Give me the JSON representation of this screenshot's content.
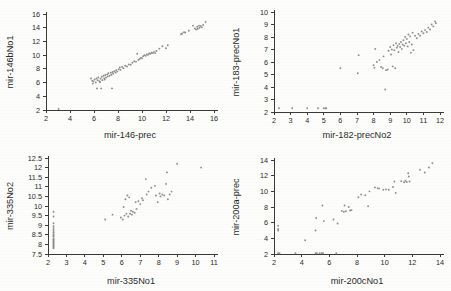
{
  "figure": {
    "background_color": "#fdfdfc",
    "marker_color": "#8d8d8d",
    "axis_color": "#3a3a3a",
    "text_color": "#2b2b2b"
  },
  "chart_data": [
    {
      "type": "scatter",
      "panel": "top-left",
      "title": "",
      "xlabel": "mir-146-prec",
      "ylabel": "mir-146bNo1",
      "xlim": [
        2,
        16
      ],
      "ylim": [
        2,
        16
      ],
      "xticks": [
        2,
        4,
        6,
        8,
        10,
        12,
        14,
        16
      ],
      "yticks": [
        2,
        4,
        6,
        8,
        10,
        12,
        14,
        16
      ],
      "xticklabels": [
        "2",
        "4",
        "6",
        "8",
        "10",
        "12",
        "14",
        "16"
      ],
      "yticklabels": [
        "2",
        "4",
        "6",
        "8",
        "10",
        "12",
        "14",
        "16"
      ],
      "grid": false,
      "legend": false,
      "points": [
        [
          3.05,
          2.15
        ],
        [
          5.75,
          6.6
        ],
        [
          5.85,
          6.25
        ],
        [
          5.95,
          6.15
        ],
        [
          5.9,
          5.85
        ],
        [
          6.05,
          6.45
        ],
        [
          6.15,
          6.0
        ],
        [
          6.2,
          6.6
        ],
        [
          6.3,
          6.35
        ],
        [
          6.25,
          5.15
        ],
        [
          6.35,
          6.75
        ],
        [
          6.45,
          6.2
        ],
        [
          6.5,
          6.05
        ],
        [
          6.55,
          6.55
        ],
        [
          6.6,
          5.15
        ],
        [
          6.65,
          6.85
        ],
        [
          6.7,
          6.35
        ],
        [
          6.8,
          7.0
        ],
        [
          6.85,
          6.6
        ],
        [
          6.9,
          6.45
        ],
        [
          6.95,
          7.1
        ],
        [
          7.0,
          6.75
        ],
        [
          7.1,
          7.2
        ],
        [
          7.15,
          6.9
        ],
        [
          7.2,
          7.35
        ],
        [
          7.3,
          7.0
        ],
        [
          7.4,
          7.45
        ],
        [
          7.45,
          7.15
        ],
        [
          7.5,
          5.15
        ],
        [
          7.55,
          7.55
        ],
        [
          7.6,
          7.3
        ],
        [
          7.7,
          7.65
        ],
        [
          7.8,
          7.45
        ],
        [
          7.85,
          7.8
        ],
        [
          7.95,
          7.6
        ],
        [
          8.05,
          7.95
        ],
        [
          8.15,
          8.2
        ],
        [
          8.2,
          7.85
        ],
        [
          8.35,
          8.3
        ],
        [
          8.45,
          8.1
        ],
        [
          8.6,
          8.45
        ],
        [
          8.75,
          8.35
        ],
        [
          8.9,
          8.65
        ],
        [
          9.05,
          8.6
        ],
        [
          9.2,
          8.9
        ],
        [
          9.35,
          9.1
        ],
        [
          9.5,
          9.05
        ],
        [
          9.6,
          10.2
        ],
        [
          9.7,
          9.3
        ],
        [
          9.8,
          9.45
        ],
        [
          9.9,
          9.6
        ],
        [
          10.0,
          9.55
        ],
        [
          10.1,
          9.85
        ],
        [
          10.2,
          10.0
        ],
        [
          10.3,
          9.9
        ],
        [
          10.4,
          10.1
        ],
        [
          10.5,
          10.05
        ],
        [
          10.6,
          10.25
        ],
        [
          10.7,
          10.2
        ],
        [
          10.8,
          10.35
        ],
        [
          10.9,
          10.3
        ],
        [
          11.0,
          10.45
        ],
        [
          11.1,
          10.3
        ],
        [
          11.2,
          10.6
        ],
        [
          11.45,
          10.95
        ],
        [
          11.7,
          11.3
        ],
        [
          12.0,
          11.0
        ],
        [
          12.15,
          11.45
        ],
        [
          13.25,
          13.05
        ],
        [
          13.35,
          13.15
        ],
        [
          13.5,
          13.35
        ],
        [
          13.6,
          13.3
        ],
        [
          13.9,
          13.55
        ],
        [
          14.25,
          14.3
        ],
        [
          14.4,
          13.9
        ],
        [
          14.5,
          13.75
        ],
        [
          14.6,
          14.15
        ],
        [
          14.65,
          13.85
        ],
        [
          14.75,
          14.3
        ],
        [
          14.8,
          14.0
        ],
        [
          14.9,
          14.25
        ],
        [
          15.0,
          14.05
        ],
        [
          15.1,
          14.4
        ],
        [
          15.3,
          14.85
        ]
      ]
    },
    {
      "type": "scatter",
      "panel": "top-right",
      "title": "",
      "xlabel": "mir-182-precNo2",
      "ylabel": "mir-183-precNo1",
      "xlim": [
        2,
        12
      ],
      "ylim": [
        2,
        10
      ],
      "xticks": [
        2,
        3,
        4,
        5,
        6,
        7,
        8,
        9,
        10,
        11,
        12
      ],
      "yticks": [
        2,
        3,
        4,
        5,
        6,
        7,
        8,
        9,
        10
      ],
      "xticklabels": [
        "2",
        "3",
        "4",
        "5",
        "6",
        "7",
        "8",
        "9",
        "10",
        "11",
        "12"
      ],
      "yticklabels": [
        "2",
        "3",
        "4",
        "5",
        "6",
        "7",
        "8",
        "9",
        "10"
      ],
      "grid": false,
      "legend": false,
      "points": [
        [
          2.3,
          2.3
        ],
        [
          3.1,
          2.3
        ],
        [
          4.0,
          2.3
        ],
        [
          4.65,
          2.3
        ],
        [
          5.0,
          2.3
        ],
        [
          5.1,
          2.3
        ],
        [
          5.15,
          2.3
        ],
        [
          6.0,
          5.5
        ],
        [
          7.05,
          5.1
        ],
        [
          7.1,
          6.55
        ],
        [
          8.0,
          5.75
        ],
        [
          8.05,
          5.55
        ],
        [
          8.1,
          7.05
        ],
        [
          8.2,
          6.0
        ],
        [
          8.35,
          6.15
        ],
        [
          8.45,
          5.6
        ],
        [
          8.55,
          5.5
        ],
        [
          8.6,
          6.45
        ],
        [
          8.7,
          3.8
        ],
        [
          8.75,
          5.35
        ],
        [
          8.85,
          5.4
        ],
        [
          8.9,
          6.9
        ],
        [
          9.0,
          7.2
        ],
        [
          9.05,
          6.6
        ],
        [
          9.1,
          7.0
        ],
        [
          9.15,
          5.65
        ],
        [
          9.2,
          7.35
        ],
        [
          9.25,
          6.95
        ],
        [
          9.3,
          5.5
        ],
        [
          9.35,
          7.5
        ],
        [
          9.4,
          7.15
        ],
        [
          9.45,
          7.3
        ],
        [
          9.5,
          6.8
        ],
        [
          9.55,
          7.45
        ],
        [
          9.6,
          7.2
        ],
        [
          9.65,
          7.6
        ],
        [
          9.7,
          7.05
        ],
        [
          9.75,
          7.4
        ],
        [
          9.8,
          7.75
        ],
        [
          9.85,
          7.3
        ],
        [
          9.9,
          8.0
        ],
        [
          9.95,
          7.5
        ],
        [
          10.0,
          7.85
        ],
        [
          10.05,
          7.25
        ],
        [
          10.1,
          8.2
        ],
        [
          10.15,
          7.6
        ],
        [
          10.2,
          8.05
        ],
        [
          10.25,
          6.75
        ],
        [
          10.3,
          7.4
        ],
        [
          10.35,
          8.35
        ],
        [
          10.4,
          6.95
        ],
        [
          10.5,
          8.1
        ],
        [
          10.6,
          7.9
        ],
        [
          10.7,
          8.25
        ],
        [
          10.8,
          8.1
        ],
        [
          10.9,
          8.45
        ],
        [
          11.0,
          8.3
        ],
        [
          11.1,
          8.55
        ],
        [
          11.2,
          8.4
        ],
        [
          11.3,
          8.75
        ],
        [
          11.4,
          8.6
        ],
        [
          11.5,
          9.0
        ],
        [
          11.6,
          8.85
        ],
        [
          11.7,
          9.25
        ],
        [
          11.75,
          9.1
        ]
      ]
    },
    {
      "type": "scatter",
      "panel": "bottom-left",
      "title": "",
      "xlabel": "mir-335No1",
      "ylabel": "mir-335No2",
      "xlim": [
        2,
        11
      ],
      "ylim": [
        7.5,
        12.5
      ],
      "xticks": [
        2,
        3,
        4,
        5,
        6,
        7,
        8,
        9,
        10,
        11
      ],
      "yticks": [
        7.5,
        8,
        8.5,
        9,
        9.5,
        10,
        10.5,
        11,
        11.5,
        12,
        12.5
      ],
      "xticklabels": [
        "2",
        "3",
        "4",
        "5",
        "6",
        "7",
        "8",
        "9",
        "10",
        "11"
      ],
      "yticklabels": [
        "7.5",
        "8",
        "8.5",
        "9",
        "9.5",
        "10",
        "10.5",
        "11",
        "11.5",
        "12",
        "12.5"
      ],
      "grid": false,
      "legend": false,
      "points": [
        [
          2.3,
          9.7
        ],
        [
          2.3,
          9.45
        ],
        [
          2.3,
          9.1
        ],
        [
          2.3,
          8.95
        ],
        [
          2.3,
          8.85
        ],
        [
          2.3,
          8.75
        ],
        [
          2.3,
          8.65
        ],
        [
          2.3,
          8.6
        ],
        [
          2.3,
          8.5
        ],
        [
          2.3,
          8.45
        ],
        [
          2.3,
          8.4
        ],
        [
          2.3,
          8.3
        ],
        [
          2.3,
          8.25
        ],
        [
          2.3,
          8.2
        ],
        [
          2.3,
          8.15
        ],
        [
          2.3,
          8.1
        ],
        [
          2.3,
          8.05
        ],
        [
          2.3,
          8.0
        ],
        [
          2.3,
          7.95
        ],
        [
          2.3,
          7.9
        ],
        [
          2.3,
          7.85
        ],
        [
          2.3,
          7.8
        ],
        [
          5.1,
          9.3
        ],
        [
          5.5,
          9.55
        ],
        [
          5.95,
          9.4
        ],
        [
          6.05,
          9.3
        ],
        [
          6.1,
          9.95
        ],
        [
          6.15,
          9.5
        ],
        [
          6.2,
          10.35
        ],
        [
          6.25,
          9.6
        ],
        [
          6.3,
          10.55
        ],
        [
          6.35,
          9.45
        ],
        [
          6.4,
          10.45
        ],
        [
          6.45,
          9.6
        ],
        [
          6.5,
          9.75
        ],
        [
          6.55,
          9.55
        ],
        [
          6.6,
          9.7
        ],
        [
          6.7,
          9.65
        ],
        [
          6.75,
          10.2
        ],
        [
          6.8,
          9.85
        ],
        [
          6.9,
          10.25
        ],
        [
          7.0,
          10.1
        ],
        [
          7.1,
          10.4
        ],
        [
          7.15,
          10.3
        ],
        [
          7.3,
          11.4
        ],
        [
          7.35,
          10.6
        ],
        [
          7.45,
          10.75
        ],
        [
          7.6,
          10.95
        ],
        [
          7.8,
          11.05
        ],
        [
          7.85,
          10.55
        ],
        [
          7.95,
          10.2
        ],
        [
          8.05,
          10.65
        ],
        [
          8.1,
          10.5
        ],
        [
          8.2,
          10.6
        ],
        [
          8.3,
          10.55
        ],
        [
          8.4,
          11.15
        ],
        [
          8.45,
          11.75
        ],
        [
          8.5,
          10.35
        ],
        [
          8.6,
          10.6
        ],
        [
          8.7,
          10.75
        ],
        [
          9.0,
          12.2
        ],
        [
          10.3,
          12.0
        ]
      ]
    },
    {
      "type": "scatter",
      "panel": "bottom-right",
      "title": "",
      "xlabel": "mir-200cNo1",
      "ylabel": "mir-200a-prec",
      "xlim": [
        2,
        14
      ],
      "ylim": [
        2,
        14
      ],
      "xticks": [
        2,
        4,
        6,
        8,
        10,
        12,
        14
      ],
      "yticks": [
        2,
        4,
        6,
        8,
        10,
        12,
        14
      ],
      "xticklabels": [
        "2",
        "4",
        "6",
        "8",
        "10",
        "12",
        "14"
      ],
      "yticklabels": [
        "2",
        "4",
        "6",
        "8",
        "10",
        "12",
        "14"
      ],
      "grid": false,
      "legend": false,
      "points": [
        [
          2.3,
          5.6
        ],
        [
          2.3,
          5.2
        ],
        [
          2.3,
          5.0
        ],
        [
          2.3,
          2.1
        ],
        [
          2.4,
          2.1
        ],
        [
          3.55,
          2.1
        ],
        [
          5.0,
          2.1
        ],
        [
          5.1,
          2.1
        ],
        [
          5.3,
          2.1
        ],
        [
          5.45,
          2.1
        ],
        [
          5.55,
          2.1
        ],
        [
          6.5,
          2.1
        ],
        [
          4.25,
          3.75
        ],
        [
          5.0,
          5.0
        ],
        [
          5.05,
          6.6
        ],
        [
          5.5,
          8.2
        ],
        [
          5.6,
          6.2
        ],
        [
          6.3,
          6.4
        ],
        [
          6.6,
          5.9
        ],
        [
          6.9,
          7.5
        ],
        [
          7.05,
          7.4
        ],
        [
          7.1,
          8.2
        ],
        [
          7.2,
          7.45
        ],
        [
          7.4,
          8.0
        ],
        [
          7.5,
          7.55
        ],
        [
          7.6,
          7.6
        ],
        [
          8.1,
          9.25
        ],
        [
          8.3,
          9.6
        ],
        [
          8.6,
          9.5
        ],
        [
          8.8,
          8.1
        ],
        [
          8.9,
          10.0
        ],
        [
          9.3,
          10.5
        ],
        [
          9.5,
          10.4
        ],
        [
          9.6,
          10.35
        ],
        [
          9.9,
          10.2
        ],
        [
          10.1,
          10.25
        ],
        [
          10.3,
          10.2
        ],
        [
          10.6,
          10.55
        ],
        [
          10.7,
          11.25
        ],
        [
          10.8,
          9.8
        ],
        [
          11.2,
          11.3
        ],
        [
          11.4,
          11.15
        ],
        [
          11.5,
          11.35
        ],
        [
          11.6,
          11.2
        ],
        [
          11.7,
          12.3
        ],
        [
          11.75,
          11.9
        ],
        [
          11.8,
          11.25
        ],
        [
          12.55,
          12.75
        ],
        [
          12.9,
          12.4
        ],
        [
          13.2,
          13.05
        ],
        [
          13.45,
          13.6
        ]
      ]
    }
  ]
}
